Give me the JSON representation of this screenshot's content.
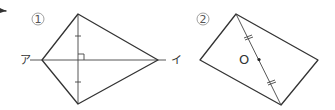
{
  "figures": [
    {
      "number": "①",
      "shape": "kite",
      "line_labels": {
        "left": "ア",
        "right": "イ"
      }
    },
    {
      "number": "②",
      "shape": "rectangle",
      "center_label": "O"
    }
  ],
  "colors": {
    "stroke": "#333333",
    "background": "#ffffff"
  }
}
